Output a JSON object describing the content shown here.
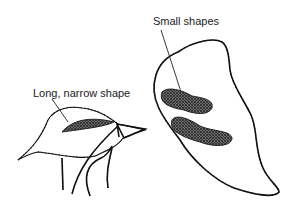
{
  "diagram": {
    "labels": {
      "left": "Long, narrow shape",
      "right": "Small shapes"
    },
    "colors": {
      "line": "#111111",
      "shade": "#555555",
      "background": "#ffffff"
    }
  }
}
